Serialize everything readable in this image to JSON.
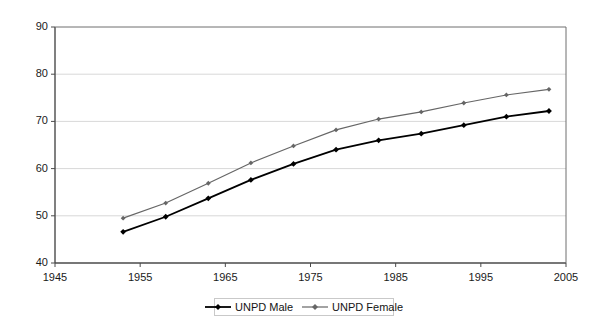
{
  "chart_data": {
    "type": "line",
    "title": "",
    "subtitle": "",
    "xlabel": "",
    "ylabel": "",
    "x": [
      1953,
      1958,
      1963,
      1968,
      1973,
      1978,
      1983,
      1988,
      1993,
      1998,
      2003
    ],
    "xtick_labels": [
      "1945",
      "1955",
      "1965",
      "1975",
      "1985",
      "1995",
      "2005"
    ],
    "xtick_values": [
      1945,
      1955,
      1965,
      1975,
      1985,
      1995,
      2005
    ],
    "ytick_labels": [
      "40",
      "50",
      "60",
      "70",
      "80",
      "90"
    ],
    "ytick_values": [
      40,
      50,
      60,
      70,
      80,
      90
    ],
    "xlim": [
      1945,
      2005
    ],
    "ylim": [
      40,
      90
    ],
    "grid": "horizontal",
    "legend_position": "bottom",
    "series": [
      {
        "name": "UNPD Male",
        "color": "#000000",
        "marker": "diamond",
        "values": [
          46.6,
          49.8,
          53.7,
          57.6,
          61.0,
          64.0,
          66.0,
          67.4,
          69.2,
          71.0,
          72.2
        ]
      },
      {
        "name": "UNPD Female",
        "color": "#666666",
        "marker": "diamond",
        "values": [
          49.5,
          52.7,
          56.9,
          61.2,
          64.8,
          68.2,
          70.5,
          72.0,
          73.9,
          75.6,
          76.8
        ]
      }
    ]
  },
  "legend": {
    "items": [
      {
        "label": "UNPD Male"
      },
      {
        "label": "UNPD Female"
      }
    ]
  }
}
